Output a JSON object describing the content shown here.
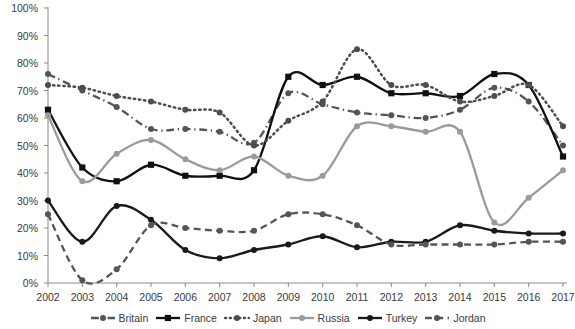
{
  "chart_data": {
    "type": "line",
    "title": "",
    "subtitle": "",
    "xlabel": "",
    "ylabel": "",
    "grid": false,
    "legend_position": "bottom",
    "x": [
      2002,
      2003,
      2004,
      2005,
      2006,
      2007,
      2008,
      2009,
      2010,
      2011,
      2012,
      2013,
      2014,
      2015,
      2016,
      2017
    ],
    "categories": [
      "2002",
      "2003",
      "2004",
      "2005",
      "2006",
      "2007",
      "2008",
      "2009",
      "2010",
      "2011",
      "2012",
      "2013",
      "2014",
      "2015",
      "2016",
      "2017"
    ],
    "ylim": [
      0,
      100
    ],
    "ytick_values": [
      0,
      10,
      20,
      30,
      40,
      50,
      60,
      70,
      80,
      90,
      100
    ],
    "ytick_labels": [
      "0%",
      "10%",
      "20%",
      "30%",
      "40%",
      "50%",
      "60%",
      "70%",
      "80%",
      "90%",
      "100%"
    ],
    "series": [
      {
        "name": "Britain",
        "color": "#555555",
        "line_style": "dashdot",
        "marker": "circle",
        "values": [
          76,
          70,
          64,
          56,
          56,
          55,
          51,
          69,
          65,
          62,
          61,
          60,
          63,
          71,
          66,
          50
        ]
      },
      {
        "name": "France",
        "color": "#111111",
        "line_style": "solid",
        "marker": "square",
        "values": [
          63,
          42,
          37,
          43,
          39,
          39,
          41,
          75,
          72,
          75,
          69,
          69,
          68,
          76,
          72,
          46
        ]
      },
      {
        "name": "Japan",
        "color": "#4d4d4d",
        "line_style": "dotted",
        "marker": "circle",
        "values": [
          72,
          71,
          68,
          66,
          63,
          62,
          50,
          59,
          66,
          85,
          72,
          72,
          66,
          68,
          72,
          57
        ]
      },
      {
        "name": "Russia",
        "color": "#9a9a9a",
        "line_style": "solid",
        "marker": "circle",
        "values": [
          61,
          37,
          47,
          52,
          45,
          41,
          46,
          39,
          39,
          57,
          57,
          55,
          55,
          22,
          31,
          41
        ]
      },
      {
        "name": "Turkey",
        "color": "#1a1a1a",
        "line_style": "solid",
        "marker": "circle",
        "values": [
          30,
          15,
          28,
          23,
          12,
          9,
          12,
          14,
          17,
          13,
          15,
          15,
          21,
          19,
          18,
          18
        ]
      },
      {
        "name": "Jordan",
        "color": "#555555",
        "line_style": "dashed",
        "marker": "circle",
        "values": [
          25,
          1,
          5,
          21,
          20,
          19,
          19,
          25,
          25,
          21,
          14,
          14,
          14,
          14,
          15,
          15
        ]
      }
    ]
  }
}
